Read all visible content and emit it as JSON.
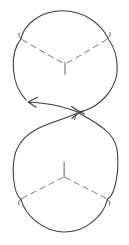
{
  "figure": {
    "title": "Pair-of-pants decomposition diagram",
    "canvas": {
      "width": 129,
      "height": 245
    },
    "background_color": "#ffffff",
    "stroke_color": "#3a3a42",
    "dashed_stroke_color": "#6b6b73"
  },
  "geometry": {
    "upper_region": {
      "name": "upper-lens",
      "top_arc": {
        "start": [
          21,
          38
        ],
        "apex": [
          65,
          11
        ],
        "end": [
          108,
          38
        ]
      },
      "left_cusp": [
        21,
        38
      ],
      "right_cusp": [
        108,
        38
      ],
      "left_bulge_x": 13,
      "right_bulge_x": 118,
      "waist_point": [
        78,
        112
      ],
      "arrow_tip": [
        28,
        102
      ]
    },
    "lower_region": {
      "name": "lower-lens",
      "bottom_arc": {
        "start": [
          21,
          199
        ],
        "nadir": [
          64,
          232
        ],
        "end": [
          107,
          199
        ]
      },
      "left_cusp": [
        21,
        199
      ],
      "right_cusp": [
        107,
        199
      ],
      "left_bulge_x": 13,
      "right_bulge_x": 118,
      "waist_point": [
        78,
        112
      ]
    },
    "upper_y_junction": {
      "center": [
        65,
        63
      ],
      "stem_end": [
        65,
        74
      ]
    },
    "lower_y_junction": {
      "center": [
        64,
        177
      ],
      "stem_end": [
        64,
        162
      ]
    },
    "pinch_point": [
      78,
      112
    ]
  },
  "labels": {
    "arrow_direction": "counterclockwise",
    "upper_piece_label": "",
    "lower_piece_label": "",
    "caption": ""
  }
}
